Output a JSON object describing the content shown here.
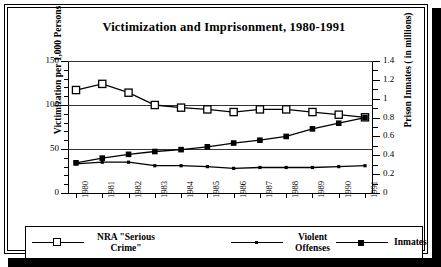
{
  "chart_data": {
    "type": "line",
    "title": "Victimization and Imprisonment, 1980-1991",
    "xlabel": "",
    "ylabel": "Victimization per 1,000 Persons",
    "y2label": "Prison Inmates ( in millions)",
    "categories": [
      "1980",
      "1981",
      "1982",
      "1983",
      "1984",
      "1985",
      "1986",
      "1987",
      "1988",
      "1989",
      "1990",
      "1991"
    ],
    "ylim": [
      0,
      150
    ],
    "yticks": [
      0,
      50,
      100,
      150
    ],
    "ytick_labels": [
      "0",
      "50",
      "100",
      "150"
    ],
    "y2lim": [
      0,
      1.4
    ],
    "y2ticks": [
      0,
      0.2,
      0.4,
      0.6,
      0.8,
      1,
      1.2,
      1.4
    ],
    "y2tick_labels": [
      "0",
      "0.2",
      "0.4",
      "0.6",
      "0.8",
      "1",
      "1.2",
      "1.4"
    ],
    "grid": true,
    "gridlines_at": [
      50,
      100,
      150
    ],
    "legend_position": "bottom",
    "series": [
      {
        "name": "NRA \"Serious Crime\"",
        "axis": "left",
        "marker": "open-square",
        "values": [
          117,
          124,
          114,
          100,
          97,
          95,
          92,
          95,
          95,
          92,
          89,
          86
        ]
      },
      {
        "name": "Violent Offenses",
        "axis": "left",
        "marker": "small-dot",
        "values": [
          33,
          35,
          35,
          31,
          31,
          30,
          28,
          29,
          29,
          29,
          30,
          31
        ]
      },
      {
        "name": "Inmates",
        "axis": "right",
        "marker": "filled-square",
        "values": [
          0.32,
          0.37,
          0.41,
          0.44,
          0.46,
          0.49,
          0.53,
          0.56,
          0.6,
          0.68,
          0.74,
          0.8
        ]
      }
    ]
  },
  "legend": {
    "items": [
      {
        "label": "NRA \"Serious Crime\"",
        "marker": "open-square"
      },
      {
        "label": "Violent Offenses",
        "marker": "small-dot"
      },
      {
        "label": "Inmates",
        "marker": "filled-square"
      }
    ]
  },
  "colors": {
    "line": "#000000",
    "grid": "#333333",
    "background": "#ffffff",
    "frame": "#000000"
  }
}
